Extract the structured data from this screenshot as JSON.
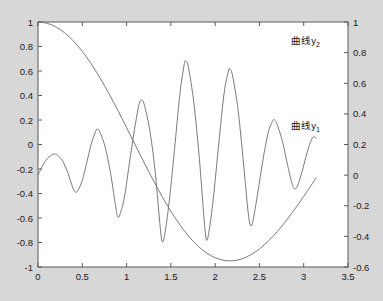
{
  "figure": {
    "background_color": "#d7d7d7",
    "plot_area_color": "#ffffff",
    "axis_color": "#5a5a5a",
    "curve_color": "#6b6b6b"
  },
  "chart_data": {
    "type": "line",
    "title": "",
    "xlabel": "",
    "ylabel": "",
    "grid": false,
    "legend_position": "inline-annotation",
    "dual_axis": true,
    "xlim": [
      0,
      3.5
    ],
    "xticks": [
      "0",
      "0.5",
      "1",
      "1.5",
      "2",
      "2.5",
      "3",
      "3.5"
    ],
    "xtick_values": [
      0,
      0.5,
      1,
      1.5,
      2,
      2.5,
      3,
      3.5
    ],
    "left_axis": {
      "ylim": [
        -1,
        1
      ],
      "yticks": [
        "-1",
        "-0.8",
        "-0.6",
        "-0.4",
        "-0.2",
        "0",
        "0.2",
        "0.4",
        "0.6",
        "0.8",
        "1"
      ],
      "ytick_values": [
        -1,
        -0.8,
        -0.6,
        -0.4,
        -0.2,
        0,
        0.2,
        0.4,
        0.6,
        0.8,
        1
      ]
    },
    "right_axis": {
      "ylim": [
        -0.6,
        1
      ],
      "yticks": [
        "-0.6",
        "-0.4",
        "-0.2",
        "0",
        "0.2",
        "0.4",
        "0.6",
        "0.8",
        "1"
      ],
      "ytick_values": [
        -0.6,
        -0.4,
        -0.2,
        0,
        0.2,
        0.4,
        0.6,
        0.8,
        1
      ]
    },
    "series": [
      {
        "name": "曲线y2",
        "axis": "left",
        "label_text": "曲线y",
        "label_sub": "2",
        "annotation_x": 3.02,
        "annotation_y": 0.82,
        "x_start": 0,
        "x_end": 3.1416,
        "formula": "cos(1.4*x)*cos(0.2*x)... smooth slow oscillation starting at 1",
        "points": [
          [
            0.0,
            1.0
          ],
          [
            0.1,
            0.99
          ],
          [
            0.2,
            0.961
          ],
          [
            0.3,
            0.912
          ],
          [
            0.4,
            0.845
          ],
          [
            0.5,
            0.76
          ],
          [
            0.6,
            0.659
          ],
          [
            0.7,
            0.544
          ],
          [
            0.8,
            0.417
          ],
          [
            0.9,
            0.281
          ],
          [
            1.0,
            0.139
          ],
          [
            1.1,
            -0.006
          ],
          [
            1.2,
            -0.15
          ],
          [
            1.3,
            -0.29
          ],
          [
            1.4,
            -0.423
          ],
          [
            1.5,
            -0.545
          ],
          [
            1.6,
            -0.654
          ],
          [
            1.7,
            -0.748
          ],
          [
            1.8,
            -0.825
          ],
          [
            1.9,
            -0.884
          ],
          [
            2.0,
            -0.924
          ],
          [
            2.1,
            -0.946
          ],
          [
            2.2,
            -0.949
          ],
          [
            2.3,
            -0.934
          ],
          [
            2.4,
            -0.901
          ],
          [
            2.5,
            -0.852
          ],
          [
            2.6,
            -0.789
          ],
          [
            2.7,
            -0.712
          ],
          [
            2.8,
            -0.624
          ],
          [
            2.9,
            -0.527
          ],
          [
            3.0,
            -0.424
          ],
          [
            3.1,
            -0.316
          ],
          [
            3.1416,
            -0.27
          ]
        ]
      },
      {
        "name": "曲线y1",
        "axis": "right",
        "label_text": "曲线y",
        "label_sub": "1",
        "annotation_x": 3.02,
        "annotation_y": 0.3,
        "x_start": 0,
        "x_end": 3.1416,
        "formula": "growing-amplitude fast oscillation",
        "points": [
          [
            0.0,
            0.0
          ],
          [
            0.05,
            0.06
          ],
          [
            0.1,
            0.105
          ],
          [
            0.15,
            0.13
          ],
          [
            0.18,
            0.138
          ],
          [
            0.22,
            0.13
          ],
          [
            0.28,
            0.09
          ],
          [
            0.34,
            0.01
          ],
          [
            0.39,
            -0.078
          ],
          [
            0.42,
            -0.11
          ],
          [
            0.45,
            -0.1
          ],
          [
            0.5,
            -0.035
          ],
          [
            0.55,
            0.08
          ],
          [
            0.6,
            0.2
          ],
          [
            0.65,
            0.285
          ],
          [
            0.67,
            0.3
          ],
          [
            0.7,
            0.28
          ],
          [
            0.76,
            0.18
          ],
          [
            0.82,
            0.01
          ],
          [
            0.87,
            -0.18
          ],
          [
            0.9,
            -0.27
          ],
          [
            0.93,
            -0.25
          ],
          [
            0.98,
            -0.13
          ],
          [
            1.03,
            0.07
          ],
          [
            1.09,
            0.3
          ],
          [
            1.14,
            0.46
          ],
          [
            1.17,
            0.49
          ],
          [
            1.2,
            0.46
          ],
          [
            1.26,
            0.3
          ],
          [
            1.32,
            0.04
          ],
          [
            1.37,
            -0.28
          ],
          [
            1.4,
            -0.43
          ],
          [
            1.43,
            -0.39
          ],
          [
            1.48,
            -0.18
          ],
          [
            1.54,
            0.16
          ],
          [
            1.6,
            0.52
          ],
          [
            1.65,
            0.72
          ],
          [
            1.67,
            0.745
          ],
          [
            1.7,
            0.7
          ],
          [
            1.76,
            0.47
          ],
          [
            1.82,
            0.12
          ],
          [
            1.87,
            -0.25
          ],
          [
            1.9,
            -0.42
          ],
          [
            1.93,
            -0.37
          ],
          [
            1.98,
            -0.15
          ],
          [
            2.04,
            0.2
          ],
          [
            2.1,
            0.53
          ],
          [
            2.15,
            0.68
          ],
          [
            2.17,
            0.69
          ],
          [
            2.2,
            0.64
          ],
          [
            2.26,
            0.42
          ],
          [
            2.32,
            0.08
          ],
          [
            2.37,
            -0.23
          ],
          [
            2.4,
            -0.33
          ],
          [
            2.43,
            -0.29
          ],
          [
            2.48,
            -0.12
          ],
          [
            2.54,
            0.1
          ],
          [
            2.6,
            0.28
          ],
          [
            2.65,
            0.355
          ],
          [
            2.67,
            0.36
          ],
          [
            2.7,
            0.33
          ],
          [
            2.76,
            0.22
          ],
          [
            2.82,
            0.06
          ],
          [
            2.87,
            -0.06
          ],
          [
            2.9,
            -0.09
          ],
          [
            2.93,
            -0.07
          ],
          [
            2.98,
            0.02
          ],
          [
            3.04,
            0.15
          ],
          [
            3.09,
            0.235
          ],
          [
            3.12,
            0.25
          ],
          [
            3.1416,
            0.24
          ]
        ]
      }
    ]
  }
}
